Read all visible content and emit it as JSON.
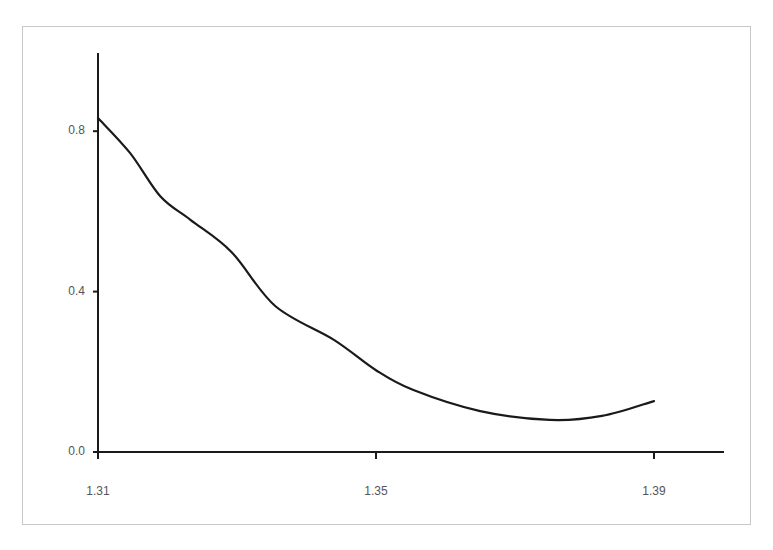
{
  "chart_data": {
    "type": "line",
    "title": "",
    "xlabel": "",
    "ylabel": "",
    "xlim": [
      1.31,
      1.4
    ],
    "ylim": [
      0.0,
      1.0
    ],
    "grid": false,
    "legend": null,
    "x_ticks": [
      "1.31",
      "1.35",
      "1.39"
    ],
    "y_ticks": [
      "0.0",
      "0.4",
      "0.8"
    ],
    "series": [
      {
        "name": "curve",
        "color": "#1a1a1a",
        "x": [
          1.31,
          1.3146,
          1.319,
          1.3233,
          1.3292,
          1.3355,
          1.344,
          1.35,
          1.3553,
          1.365,
          1.375,
          1.3825,
          1.39
        ],
        "y": [
          0.833,
          0.746,
          0.637,
          0.579,
          0.499,
          0.364,
          0.279,
          0.204,
          0.155,
          0.102,
          0.08,
          0.09,
          0.127
        ]
      }
    ]
  },
  "axes": {
    "y_labels": [
      {
        "text": "0.8",
        "value": 0.8
      },
      {
        "text": "0.4",
        "value": 0.4
      },
      {
        "text": "0.0",
        "value": 0.0
      }
    ],
    "x_labels": [
      {
        "text": "1.31",
        "value": 1.31
      },
      {
        "text": "1.35",
        "value": 1.35
      },
      {
        "text": "1.39",
        "value": 1.39
      }
    ]
  }
}
